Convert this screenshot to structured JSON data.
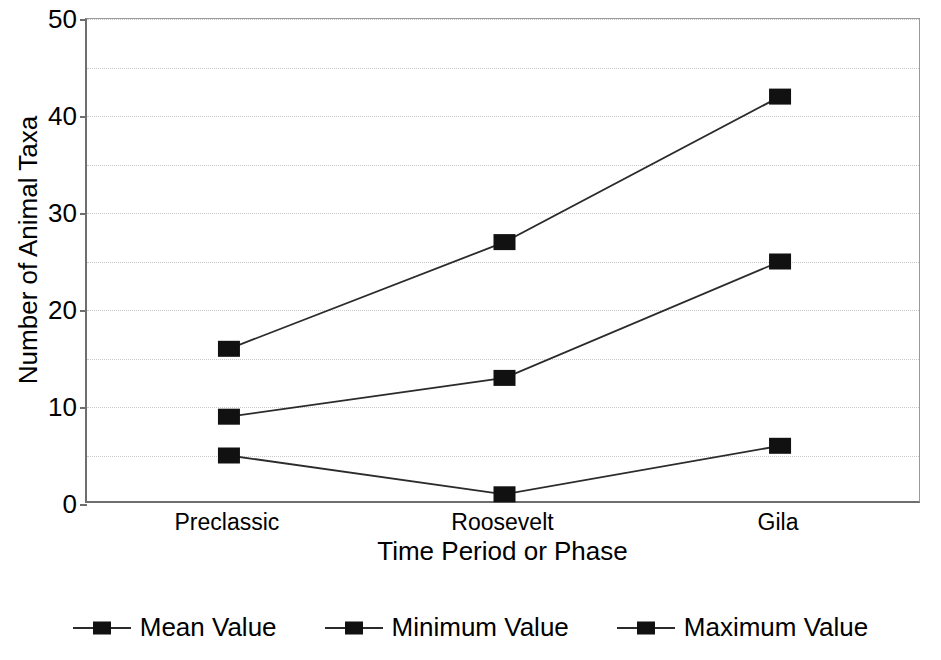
{
  "chart_data": {
    "type": "line",
    "title": "",
    "xlabel": "Time Period or Phase",
    "ylabel": "Number of Animal Taxa",
    "categories": [
      "Preclassic",
      "Roosevelt",
      "Gila"
    ],
    "series": [
      {
        "name": "Mean Value",
        "values": [
          9,
          13,
          25
        ],
        "color": "#111111",
        "marker": "square"
      },
      {
        "name": "Minimum Value",
        "values": [
          5,
          1,
          6
        ],
        "color": "#111111",
        "marker": "square"
      },
      {
        "name": "Maximum Value",
        "values": [
          16,
          27,
          42
        ],
        "color": "#111111",
        "marker": "square"
      }
    ],
    "ylim": [
      0,
      50
    ],
    "ytick_labels": [
      "0",
      "10",
      "20",
      "30",
      "40",
      "50"
    ],
    "ytick_values": [
      0,
      10,
      20,
      30,
      40,
      50
    ],
    "minor_gridline_values": [
      5,
      15,
      25,
      35,
      45
    ],
    "grid": "horizontal-dotted",
    "legend_position": "bottom",
    "axis_color": "#6e6e6e",
    "grid_color": "#c9c9c9",
    "line_color": "#2b2b2b",
    "marker_color": "#111111",
    "background": "#ffffff"
  },
  "legend": {
    "items": [
      {
        "label": "Mean Value"
      },
      {
        "label": "Minimum Value"
      },
      {
        "label": "Maximum Value"
      }
    ]
  }
}
